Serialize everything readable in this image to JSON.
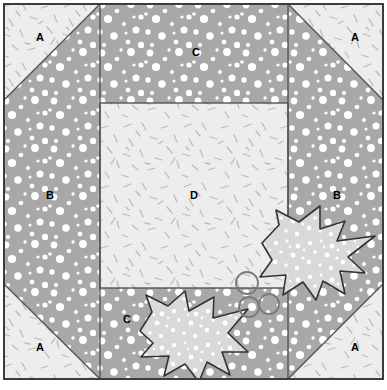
{
  "diagram": {
    "canvas": {
      "width": 387,
      "height": 390
    },
    "block": {
      "x": 4,
      "y": 4,
      "width": 379,
      "height": 375
    },
    "colors": {
      "background": "#ffffff",
      "outline": "#3c3c3c",
      "seam_line": "#555555",
      "light_fabric": "#ededed",
      "light_fabric_alt": "#f0f0f0",
      "dotted_fabric": "#a8a8a8",
      "dot_color": "#ffffff",
      "dash_color": "#b8b8b8",
      "leaf_fill": "#d9d9d9",
      "leaf_outline": "#333333",
      "berry_outline": "#7a7a7a",
      "label_color": "#000000"
    },
    "geometry": {
      "corner_size": 96,
      "seam_top": 103,
      "seam_bottom": 288,
      "seam_left": 100,
      "seam_right": 288
    },
    "labels": [
      {
        "text": "A",
        "x": 40,
        "y": 38,
        "piece": "corner-triangle-top-left"
      },
      {
        "text": "A",
        "x": 355,
        "y": 38,
        "piece": "corner-triangle-top-right"
      },
      {
        "text": "A",
        "x": 40,
        "y": 348,
        "piece": "corner-triangle-bottom-left"
      },
      {
        "text": "A",
        "x": 355,
        "y": 348,
        "piece": "corner-triangle-bottom-right"
      },
      {
        "text": "B",
        "x": 50,
        "y": 196,
        "piece": "side-panel-left"
      },
      {
        "text": "B",
        "x": 337,
        "y": 196,
        "piece": "side-panel-right"
      },
      {
        "text": "C",
        "x": 196,
        "y": 53,
        "piece": "side-panel-top"
      },
      {
        "text": "C",
        "x": 127,
        "y": 320,
        "piece": "side-panel-bottom"
      },
      {
        "text": "D",
        "x": 194,
        "y": 196,
        "piece": "center-square"
      }
    ],
    "pieces": [
      {
        "code": "A",
        "name": "corner-triangle",
        "fabric": "light-dashed",
        "count": 4
      },
      {
        "code": "B",
        "name": "side-panel-vertical",
        "fabric": "gray-dotted",
        "count": 2
      },
      {
        "code": "C",
        "name": "side-panel-horizontal",
        "fabric": "gray-dotted",
        "count": 2
      },
      {
        "code": "D",
        "name": "center-square",
        "fabric": "light-dashed",
        "count": 1
      }
    ],
    "applique": {
      "leaves": [
        {
          "name": "holly-leaf-right",
          "points": "262,243 279,225 276,210 299,222 320,206 320,229 345,221 337,241 375,236 348,257 365,273 340,271 345,294 323,281 316,300 303,282 283,295 286,275 260,277 272,260",
          "fill": "#d9d9d9",
          "dot_count": 58
        },
        {
          "name": "holly-leaf-left",
          "points": "140,331 152,312 146,295 168,306 185,291 189,311 214,297 213,318 248,309 228,333 248,352 222,352 230,375 207,362 199,382 185,364 164,376 169,356 141,357 153,343",
          "fill": "#d9d9d9",
          "dot_count": 52
        }
      ],
      "berries": [
        {
          "name": "berry-upper",
          "cx": 247,
          "cy": 283,
          "r": 11
        },
        {
          "name": "berry-lower-left",
          "cx": 249,
          "cy": 307,
          "r": 10
        },
        {
          "name": "berry-lower-right",
          "cx": 269,
          "cy": 304,
          "r": 10
        }
      ]
    }
  }
}
